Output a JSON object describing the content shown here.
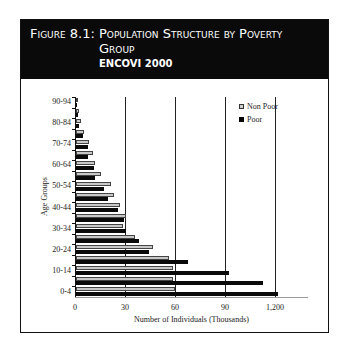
{
  "header": {
    "figure_label": "Figure 8.1:",
    "title": "Population Structure by Poverty Group",
    "subtitle": "ENCOVI 2000"
  },
  "chart_data": {
    "type": "bar",
    "orientation": "horizontal",
    "title": "Population Structure by Poverty Group",
    "subtitle": "ENCOVI 2000",
    "xlabel": "Number of Individuals (Thousands)",
    "ylabel": "Age Groups",
    "x_ticks": [
      "0",
      "30",
      "60",
      "90",
      "1,200"
    ],
    "xlim": [
      0,
      140
    ],
    "grid": "vertical",
    "legend_position": "upper right",
    "categories": [
      "0-4",
      "5-9",
      "10-14",
      "15-19",
      "20-24",
      "25-29",
      "30-34",
      "35-39",
      "40-44",
      "45-49",
      "50-54",
      "55-59",
      "60-64",
      "65-69",
      "70-74",
      "75-79",
      "80-84",
      "85-89",
      "90-94"
    ],
    "y_tick_labels": [
      "0-4",
      "10-14",
      "20-24",
      "30-34",
      "40-44",
      "50-54",
      "60-64",
      "70-74",
      "80-84",
      "90-94"
    ],
    "series": [
      {
        "name": "Non Poor",
        "color": "#c8c8c8",
        "values": [
          59.5,
          58,
          58,
          55.5,
          46,
          35.5,
          28,
          30,
          26.5,
          23,
          21,
          15,
          11.5,
          10,
          7.5,
          5,
          3,
          2,
          0.5
        ]
      },
      {
        "name": "Poor",
        "color": "#0a0a0a",
        "values": [
          121,
          112,
          92,
          67,
          44,
          37.5,
          30,
          28.5,
          25,
          19,
          17,
          11.5,
          10.5,
          7,
          7,
          4,
          2,
          1,
          0.3
        ]
      }
    ]
  },
  "legend": {
    "items": [
      {
        "label": "Non Poor"
      },
      {
        "label": "Poor"
      }
    ]
  }
}
